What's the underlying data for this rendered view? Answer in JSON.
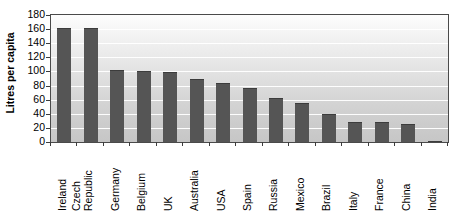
{
  "chart_data": {
    "type": "bar",
    "title": "",
    "xlabel": "",
    "ylabel": "Litres per capita",
    "ylim": [
      0,
      180
    ],
    "ytick_step": 20,
    "yticks": [
      180,
      160,
      140,
      120,
      100,
      80,
      60,
      40,
      20,
      0
    ],
    "grid": true,
    "legend": "none",
    "categories": [
      "Ireland",
      "Czech Republic",
      "Germany",
      "Belgium",
      "UK",
      "Australia",
      "USA",
      "Spain",
      "Russia",
      "Mexico",
      "Brazil",
      "Italy",
      "France",
      "China",
      "India"
    ],
    "values": [
      162,
      162,
      102,
      101,
      99,
      89,
      84,
      76,
      63,
      55,
      40,
      29,
      28,
      25,
      1
    ],
    "bar_color": "#555555",
    "plot_background": "#dcdcdc",
    "gridline_color": "#ffffff",
    "axis_color": "#4a4a4a"
  },
  "axis": {
    "y_title": "Litres per capita"
  }
}
